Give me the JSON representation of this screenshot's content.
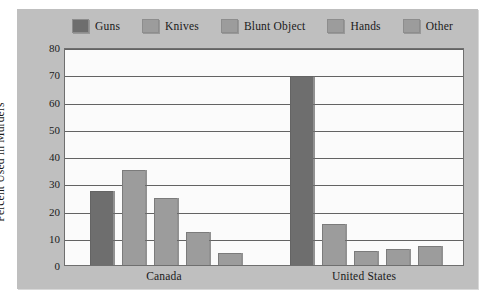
{
  "chart_data": {
    "type": "bar",
    "title": "",
    "subtitle": "",
    "xlabel": "",
    "ylabel": "Percent Used in Murders",
    "ylim": [
      0,
      80
    ],
    "ytick_step": 10,
    "yticks": [
      "80",
      "70",
      "60",
      "50",
      "40",
      "30",
      "20",
      "10",
      "0"
    ],
    "grid": true,
    "legend_position": "top",
    "categories": [
      "Canada",
      "United States"
    ],
    "series": [
      {
        "name": "Guns",
        "color": "#6e6e6e",
        "values": [
          27,
          69.5
        ]
      },
      {
        "name": "Knives",
        "color": "#9c9c9c",
        "values": [
          35,
          15
        ]
      },
      {
        "name": "Blunt Object",
        "color": "#9c9c9c",
        "values": [
          24.5,
          5
        ]
      },
      {
        "name": "Hands",
        "color": "#9c9c9c",
        "values": [
          12,
          6
        ]
      },
      {
        "name": "Other",
        "color": "#9c9c9c",
        "values": [
          4.5,
          7
        ]
      }
    ]
  },
  "colors": {
    "card_background": "#bfbfbf",
    "plot_background": "#fbfbfb",
    "gridline": "#636363",
    "axis_border": "#6f6f6f",
    "text": "#1a1a1a",
    "bar_dark": "#6e6e6e",
    "bar_light": "#9c9c9c"
  }
}
